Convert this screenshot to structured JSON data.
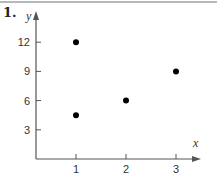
{
  "problem_number": "1.",
  "colors": {
    "axis": "#555555",
    "point": "#000000",
    "text": "#333333",
    "top_rule": "#b8b8b8"
  },
  "chart_data": {
    "type": "scatter",
    "title": "",
    "xlabel": "x",
    "ylabel": "y",
    "x_ticks": [
      1,
      2,
      3
    ],
    "y_ticks": [
      3,
      6,
      9,
      12
    ],
    "x_tick_labels": [
      "1",
      "2",
      "3"
    ],
    "y_tick_labels": [
      "3",
      "6",
      "9",
      "12"
    ],
    "xlim": [
      0,
      3.4
    ],
    "ylim": [
      0,
      14
    ],
    "grid": false,
    "legend": null,
    "points": [
      {
        "x": 1,
        "y": 12
      },
      {
        "x": 1,
        "y": 4.5
      },
      {
        "x": 2,
        "y": 6
      },
      {
        "x": 3,
        "y": 9
      }
    ]
  }
}
